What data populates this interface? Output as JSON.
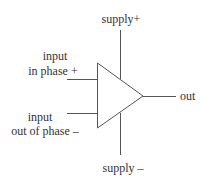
{
  "diagram": {
    "colors": {
      "line": "#555555",
      "text": "#333333",
      "background": "#ffffff"
    },
    "labels": {
      "supply_plus": "supply+",
      "input_plus_line1": "input",
      "input_plus_line2": "in phase +",
      "input_minus_line1": "input",
      "input_minus_line2": "out of phase –",
      "output": "out",
      "supply_minus": "supply –"
    }
  }
}
